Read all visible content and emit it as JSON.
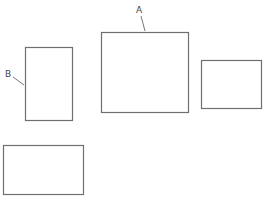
{
  "diagram": {
    "labels": {
      "a": "A",
      "b": "B"
    },
    "boxes": [
      {
        "id": "box-a",
        "x": 101,
        "y": 32,
        "w": 87,
        "h": 80,
        "label": "A"
      },
      {
        "id": "box-b",
        "x": 25,
        "y": 47,
        "w": 47,
        "h": 73,
        "label": "B"
      },
      {
        "id": "box-right",
        "x": 201,
        "y": 60,
        "w": 60,
        "h": 48
      },
      {
        "id": "box-bottom-left",
        "x": 3,
        "y": 145,
        "w": 80,
        "h": 49
      }
    ],
    "colors": {
      "stroke": "#6f6f6f",
      "background": "#ffffff"
    }
  }
}
